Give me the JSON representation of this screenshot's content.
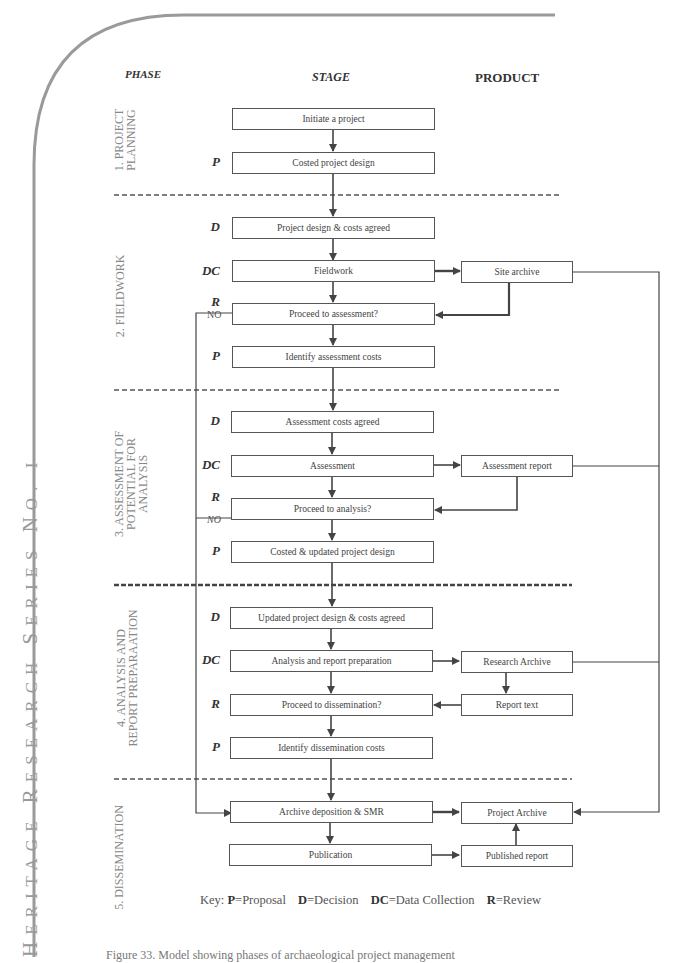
{
  "side_title": {
    "parts": [
      {
        "cap": "H",
        "rest": "ERITAGE "
      },
      {
        "cap": "R",
        "rest": "ESEARCH "
      },
      {
        "cap": "S",
        "rest": "ERIES "
      },
      {
        "cap": "N",
        "rest": "O. I"
      }
    ]
  },
  "headers": {
    "phase": "PHASE",
    "stage": "STAGE",
    "product": "PRODUCT"
  },
  "phases": [
    {
      "line1": "1. PROJECT",
      "line2": "PLANNING"
    },
    {
      "line1": "2. FIELDWORK",
      "line2": ""
    },
    {
      "line1": "3. ASSESSMENT OF",
      "line2": "POTENTIAL FOR",
      "line3": "ANALYSIS"
    },
    {
      "line1": "4. ANALYSIS AND",
      "line2": "REPORT PREPARAATION"
    },
    {
      "line1": "5. DISSEMINATION",
      "line2": ""
    }
  ],
  "stages": [
    {
      "code": "",
      "label": "Initiate a project"
    },
    {
      "code": "P",
      "label": "Costed project design"
    },
    {
      "code": "D",
      "label": "Project design & costs agreed"
    },
    {
      "code": "DC",
      "label": "Fieldwork"
    },
    {
      "code": "R",
      "label": "Proceed to assessment?",
      "branch": "NO"
    },
    {
      "code": "P",
      "label": "Identify assessment costs"
    },
    {
      "code": "D",
      "label": "Assessment costs agreed"
    },
    {
      "code": "DC",
      "label": "Assessment"
    },
    {
      "code": "R",
      "label": "Proceed to analysis?",
      "branch": "NO"
    },
    {
      "code": "P",
      "label": "Costed & updated project design"
    },
    {
      "code": "D",
      "label": "Updated project design & costs agreed"
    },
    {
      "code": "DC",
      "label": "Analysis and report preparation"
    },
    {
      "code": "R",
      "label": "Proceed to dissemination?"
    },
    {
      "code": "P",
      "label": "Identify dissemination costs"
    },
    {
      "code": "",
      "label": "Archive deposition & SMR"
    },
    {
      "code": "",
      "label": "Publication"
    }
  ],
  "products": [
    {
      "label": "Site archive"
    },
    {
      "label": "Assessment report"
    },
    {
      "label": "Research Archive"
    },
    {
      "label": "Report text"
    },
    {
      "label": "Project Archive"
    },
    {
      "label": "Published report"
    }
  ],
  "key": {
    "prefix": "Key:",
    "items": [
      {
        "code": "P",
        "meaning": "=Proposal"
      },
      {
        "code": "D",
        "meaning": "=Decision"
      },
      {
        "code": "DC",
        "meaning": "=Data Collection"
      },
      {
        "code": "R",
        "meaning": "=Review"
      }
    ]
  },
  "caption": "Figure 33. Model showing phases of archaeological project management"
}
